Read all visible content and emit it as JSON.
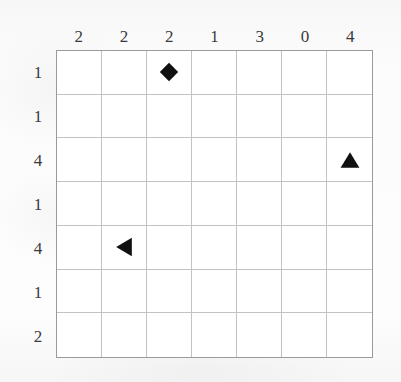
{
  "puzzle": {
    "type": "grid-puzzle",
    "rows": 7,
    "columns": 7,
    "column_headers": [
      "2",
      "2",
      "2",
      "1",
      "3",
      "0",
      "4"
    ],
    "row_headers": [
      "1",
      "1",
      "4",
      "1",
      "4",
      "1",
      "2"
    ],
    "markers": [
      {
        "shape": "diamond",
        "glyph": "◆",
        "row": 1,
        "col": 3,
        "color": "#111111"
      },
      {
        "shape": "triangle-up",
        "glyph": "▲",
        "row": 3,
        "col": 7,
        "color": "#111111"
      },
      {
        "shape": "triangle-left",
        "glyph": "◀",
        "row": 5,
        "col": 2,
        "color": "#111111"
      }
    ],
    "colors": {
      "page_background": "#fbfbfb",
      "grid_background": "#ffffff",
      "grid_line": "#c2c2c6",
      "grid_border": "#9a9a9e",
      "label_text": "#3a3a3c",
      "marker_fill": "#111111"
    }
  }
}
